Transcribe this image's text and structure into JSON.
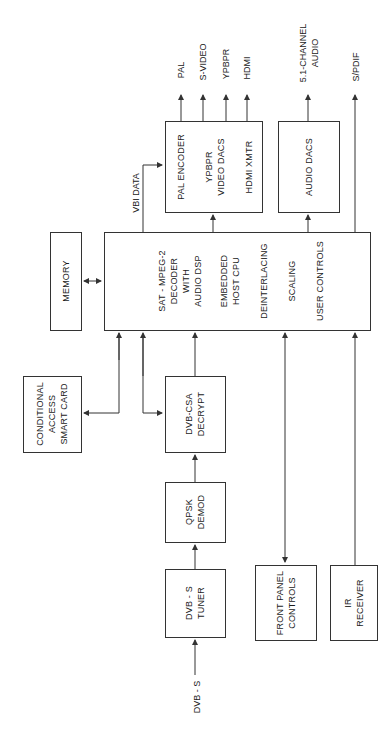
{
  "diagram": {
    "blocks": {
      "tuner": [
        "DVB - S",
        "TUNER"
      ],
      "qpsk": [
        "QPSK",
        "DEMOD"
      ],
      "decrypt": [
        "DVB-CSA",
        "DECRYPT"
      ],
      "smart_card": [
        "CONDITIONAL",
        "ACCESS",
        "SMART  CARD"
      ],
      "memory": [
        "MEMORY"
      ],
      "decoder": {
        "sections": [
          [
            "SAT - MPEG-2",
            "DECODER",
            "WITH",
            "AUDIO  DSP"
          ],
          [
            "EMBEDDED",
            "HOST  CPU"
          ],
          [
            "DEINTERLACING"
          ],
          [
            "SCALING"
          ],
          [
            "USER  CONTROLS"
          ]
        ]
      },
      "video_out": {
        "sections": [
          [
            "PAL  ENCODER"
          ],
          [
            "YPBPR",
            "VIDEO  DACS"
          ],
          [
            "HDMI  XMTR"
          ]
        ]
      },
      "audio_dacs": [
        "AUDIO  DACS"
      ],
      "front_panel": [
        "FRONT  PANEL",
        "CONTROLS"
      ],
      "ir_receiver": [
        "IR",
        "RECEIVER"
      ]
    },
    "signals": {
      "input": "DVB - S",
      "vbi": "VBI  DATA",
      "outputs": [
        "PAL",
        "S-VIDEO",
        "YPBPR",
        "HDMI"
      ],
      "audio_out": [
        "5.1-CHANNEL",
        "AUDIO"
      ],
      "spdif": "S/PDIF"
    },
    "colors": {
      "line": "#333333",
      "background": "#ffffff"
    }
  }
}
